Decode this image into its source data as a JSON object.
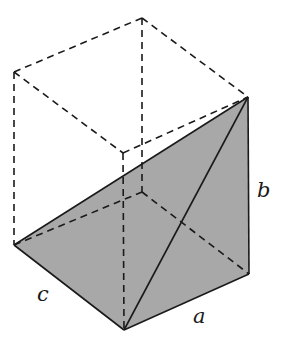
{
  "figure": {
    "colors": {
      "shade": "#a8a8a8",
      "line": "#1a1a1a",
      "background": "#ffffff"
    },
    "labels": {
      "a": "a",
      "b": "b",
      "c": "c"
    }
  }
}
